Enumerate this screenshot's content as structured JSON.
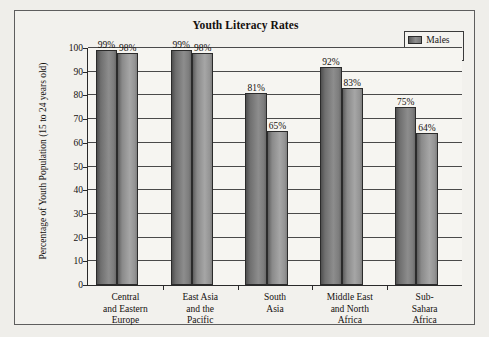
{
  "chart_data": {
    "type": "bar",
    "title": "Youth Literacy Rates",
    "xlabel": "",
    "ylabel": "Percentage of Youth Population (15 to 24 years old)",
    "ylim": [
      0,
      100
    ],
    "yticks": [
      0,
      10,
      20,
      30,
      40,
      50,
      60,
      70,
      80,
      90,
      100
    ],
    "ytick_labels": [
      "0",
      "10",
      "20",
      "30",
      "40",
      "50",
      "60",
      "70",
      "80",
      "90",
      "100"
    ],
    "grid": true,
    "legend_position": "top-right",
    "categories": [
      "Central\nand Eastern\nEurope",
      "East Asia\nand the\nPacific",
      "South\nAsia",
      "Middle East\nand North\nAfrica",
      "Sub-\nSahara\nAfrica"
    ],
    "category_lines": [
      [
        "Central",
        "and Eastern",
        "Europe"
      ],
      [
        "East Asia",
        "and the",
        "Pacific"
      ],
      [
        "South",
        "Asia"
      ],
      [
        "Middle East",
        "and North",
        "Africa"
      ],
      [
        "Sub-",
        "Sahara",
        "Africa"
      ]
    ],
    "series": [
      {
        "name": "Males",
        "color": "#7d7d7d",
        "values": [
          99,
          99,
          81,
          92,
          75
        ],
        "labels": [
          "99%",
          "99%",
          "81%",
          "92%",
          "75%"
        ]
      },
      {
        "name": "Females",
        "color": "#9b9b9b",
        "values": [
          98,
          98,
          65,
          83,
          64
        ],
        "labels": [
          "98%",
          "98%",
          "65%",
          "83%",
          "64%"
        ]
      }
    ]
  },
  "legend": {
    "items": [
      {
        "label": "Males",
        "swatch": "males"
      },
      {
        "label": "Females",
        "swatch": "females"
      }
    ]
  },
  "colors": {
    "page_background": "#efeeea",
    "figure_background": "#f2f1ed",
    "plot_background": "#f6f5f1",
    "axis": "#2a2a2a",
    "grid": "#4a4a4a",
    "text": "#14100d",
    "males_bar": "#7d7d7d",
    "females_bar": "#9b9b9b"
  }
}
